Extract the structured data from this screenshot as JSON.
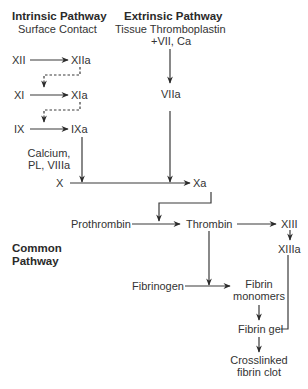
{
  "diagram": {
    "title_intrinsic": "Intrinsic Pathway",
    "sub_intrinsic": "Surface Contact",
    "title_extrinsic": "Extrinsic Pathway",
    "sub_extrinsic_1": "Tissue Thromboplastin",
    "sub_extrinsic_2": "+VII, Ca",
    "common_1": "Common",
    "common_2": "Pathway",
    "nodes": {
      "XII": "XII",
      "XIIa": "XIIa",
      "XI": "XI",
      "XIa": "XIa",
      "IX": "IX",
      "IXa": "IXa",
      "cofactor_1": "Calcium,",
      "cofactor_2": "PL, VIIIa",
      "X": "X",
      "Xa": "Xa",
      "VIIa": "VIIa",
      "Prothrombin": "Prothrombin",
      "Thrombin": "Thrombin",
      "XIII": "XIII",
      "XIIIa": "XIIIa",
      "Fibrinogen": "Fibrinogen",
      "Fibrin_monomers_1": "Fibrin",
      "Fibrin_monomers_2": "monomers",
      "Fibrin_gel": "Fibrin gel",
      "Clot_1": "Crosslinked",
      "Clot_2": "fibrin clot"
    },
    "edges": [
      "XII -> XIIa",
      "XIIa -.-> XI->XIa",
      "XI -> XIa",
      "XIa -.-> IX->IXa",
      "IX -> IXa",
      "IXa -> X->Xa (Calcium, PL, VIIIa)",
      "Tissue Thromboplastin -> VIIa",
      "VIIa -> X->Xa",
      "X -> Xa",
      "Xa -> Prothrombin->Thrombin",
      "Prothrombin -> Thrombin",
      "Thrombin -> XIII",
      "XIII -> XIIIa",
      "Thrombin -> Fibrinogen->Fibrin monomers",
      "Fibrinogen -> Fibrin monomers",
      "Fibrin monomers -> Fibrin gel",
      "XIIIa -> Fibrin gel",
      "Fibrin gel -> Crosslinked fibrin clot"
    ],
    "colors": {
      "line": "#3a3a3a",
      "text": "#333333"
    }
  }
}
